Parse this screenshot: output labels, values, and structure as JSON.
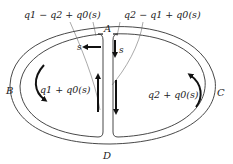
{
  "diagram": {
    "labels": {
      "A": "A",
      "B": "B",
      "C": "C",
      "D": "D",
      "s_left": "s",
      "s_right": "s"
    },
    "annotations": {
      "top_left": "q1 − q2 + q0(s)",
      "top_right": "q2 − q1 + q0(s)",
      "left_cell": "q1 + q0(s)",
      "right_cell": "q2 + q0(s)"
    },
    "colors": {
      "stroke": "#333333",
      "arrow": "#111111",
      "text": "#222222",
      "background": "#ffffff"
    }
  }
}
